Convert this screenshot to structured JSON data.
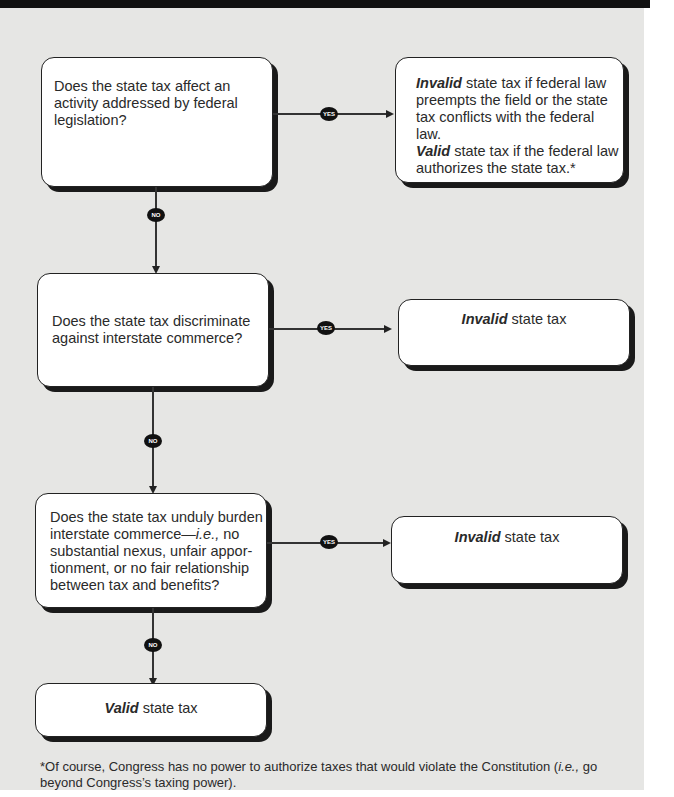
{
  "flowchart": {
    "questions": [
      {
        "id": "q1",
        "text": "Does the state tax affect an activity addressed by federal legislation?",
        "lines": [
          "Does the state tax affect an",
          "activity addressed by federal",
          "legislation?"
        ]
      },
      {
        "id": "q2",
        "text": "Does the state tax discriminate against interstate commerce?",
        "lines": [
          "Does the state tax discriminate",
          "against interstate commerce?"
        ]
      },
      {
        "id": "q3",
        "text": "Does the state tax unduly burden interstate commerce—i.e., no substantial nexus, unfair apportionment, or no fair relationship between tax and benefits?",
        "line1": "Does the state tax unduly burden",
        "line2_pre": "interstate commerce—",
        "line2_ital": "i.e.,",
        "line2_post": " no",
        "line3": "substantial nexus, unfair appor-",
        "line4": "tionment, or no fair relationship",
        "line5": "between tax and benefits?"
      }
    ],
    "outcomes": [
      {
        "id": "o1",
        "bold1": "Invalid",
        "rest1": " state tax if federal law",
        "line2": "preempts the field or the state",
        "line3": "tax conflicts with the federal law.",
        "bold4": "Valid",
        "rest4": " state tax if the federal law",
        "line5": "authorizes the state tax.*"
      },
      {
        "id": "o2",
        "bold": "Invalid",
        "rest": " state tax"
      },
      {
        "id": "o3",
        "bold": "Invalid",
        "rest": " state tax"
      },
      {
        "id": "o4",
        "bold": "Valid",
        "rest": " state tax"
      }
    ],
    "labels": {
      "yes": "YES",
      "no": "NO"
    },
    "edges": [
      {
        "from": "q1",
        "to": "o1",
        "label": "YES"
      },
      {
        "from": "q1",
        "to": "q2",
        "label": "NO"
      },
      {
        "from": "q2",
        "to": "o2",
        "label": "YES"
      },
      {
        "from": "q2",
        "to": "q3",
        "label": "NO"
      },
      {
        "from": "q3",
        "to": "o3",
        "label": "YES"
      },
      {
        "from": "q3",
        "to": "o4",
        "label": "NO"
      }
    ]
  },
  "footnote": {
    "pre": "*Of course, Congress has no power to authorize taxes that would violate the Constitution (",
    "ital": "i.e.,",
    "post": " go beyond Congress’s taxing power)."
  }
}
